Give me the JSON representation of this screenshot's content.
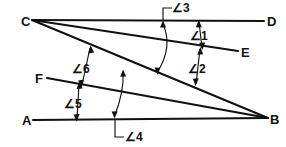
{
  "figure": {
    "width": 286,
    "height": 147,
    "background_color": "#ffffff",
    "stroke_color": "#111111"
  },
  "points": [
    {
      "id": "A",
      "label": "A",
      "x": 33,
      "y": 120
    },
    {
      "id": "B",
      "label": "B",
      "x": 268,
      "y": 118
    },
    {
      "id": "C",
      "label": "C",
      "x": 32,
      "y": 20
    },
    {
      "id": "D",
      "label": "D",
      "x": 264,
      "y": 21
    },
    {
      "id": "E",
      "label": "E",
      "x": 238,
      "y": 51
    },
    {
      "id": "F",
      "label": "F",
      "x": 47,
      "y": 78
    }
  ],
  "vertex_labels": [
    {
      "name": "point-label-c",
      "text": "C",
      "x": 21,
      "y": 26
    },
    {
      "name": "point-label-d",
      "text": "D",
      "x": 267,
      "y": 26
    },
    {
      "name": "point-label-e",
      "text": "E",
      "x": 241,
      "y": 57
    },
    {
      "name": "point-label-f",
      "text": "F",
      "x": 35,
      "y": 83
    },
    {
      "name": "point-label-a",
      "text": "A",
      "x": 22,
      "y": 125
    },
    {
      "name": "point-label-b",
      "text": "B",
      "x": 270,
      "y": 124
    }
  ],
  "segments": [
    {
      "name": "segment-cd",
      "from": "C",
      "to": "D"
    },
    {
      "name": "segment-ce",
      "from": "C",
      "to": "E"
    },
    {
      "name": "segment-cb",
      "from": "C",
      "to": "B"
    },
    {
      "name": "segment-fb",
      "from": "F",
      "to": "B"
    },
    {
      "name": "segment-ab",
      "from": "A",
      "to": "B"
    }
  ],
  "angle_markers": [
    {
      "id": "angle-3",
      "label": "∠3",
      "label_x": 172,
      "label_y": 12,
      "between": [
        "segment-cd",
        "segment-cb"
      ],
      "style": "arc-with-leader"
    },
    {
      "id": "angle-1",
      "label": "∠1",
      "label_x": 190,
      "label_y": 40,
      "between": [
        "segment-cd",
        "segment-ce"
      ],
      "style": "double-arrow"
    },
    {
      "id": "angle-2",
      "label": "∠2",
      "label_x": 188,
      "label_y": 73,
      "between": [
        "segment-ce",
        "segment-cb"
      ],
      "style": "double-arrow"
    },
    {
      "id": "angle-6",
      "label": "∠6",
      "label_x": 72,
      "label_y": 73,
      "between": [
        "segment-cb",
        "segment-fb"
      ],
      "style": "double-arrow"
    },
    {
      "id": "angle-5",
      "label": "∠5",
      "label_x": 64,
      "label_y": 108,
      "between": [
        "segment-fb",
        "segment-ab"
      ],
      "style": "double-arrow"
    },
    {
      "id": "angle-4",
      "label": "∠4",
      "label_x": 125,
      "label_y": 141,
      "between": [
        "segment-ab",
        "segment-cb"
      ],
      "style": "arc-with-leader"
    }
  ]
}
